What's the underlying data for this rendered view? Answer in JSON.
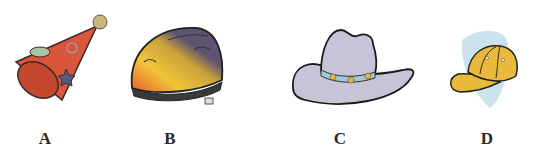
{
  "items": [
    {
      "id": "A",
      "label": "A",
      "name": "party-hat"
    },
    {
      "id": "B",
      "label": "B",
      "name": "bike-helmet"
    },
    {
      "id": "C",
      "label": "C",
      "name": "cowboy-hat"
    },
    {
      "id": "D",
      "label": "D",
      "name": "baseball-cap"
    }
  ],
  "colors": {
    "party_hat": "#d9553b",
    "party_pom": "#c9b77a",
    "helmet_purple": "#5e5370",
    "helmet_yellow": "#f0c43a",
    "helmet_orange": "#e8602a",
    "cowboy_hat": "#c9c3d8",
    "hat_band": "#9ec8d8",
    "cap_yellow": "#e8b93a",
    "cap_shadow": "#a9d0e0"
  }
}
